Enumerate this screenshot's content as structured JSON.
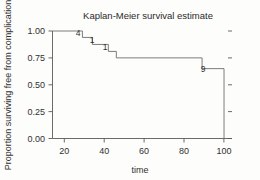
{
  "chart_data": {
    "type": "line",
    "subtype": "kaplan-meier-step",
    "title": "Kaplan-Meier survival estimate",
    "xlabel": "time",
    "ylabel": "Proportion surviving free from complication",
    "xlim": [
      14,
      104
    ],
    "ylim": [
      0.0,
      1.0
    ],
    "grid": false,
    "legend": "none",
    "xticks": [
      20,
      40,
      60,
      80,
      100
    ],
    "xtick_labels": [
      "20",
      "40",
      "60",
      "80",
      "100"
    ],
    "yticks": [
      0.0,
      0.25,
      0.5,
      0.75,
      1.0
    ],
    "ytick_labels": [
      "0.00",
      "0.25",
      "0.50",
      "0.75",
      "1.00"
    ],
    "series": [
      {
        "name": "survival",
        "step": "post",
        "x": [
          14,
          29,
          29,
          34,
          34,
          42,
          42,
          46,
          46,
          89,
          89,
          100,
          100
        ],
        "y": [
          1.0,
          1.0,
          0.94,
          0.94,
          0.875,
          0.875,
          0.81,
          0.81,
          0.75,
          0.75,
          0.65,
          0.65,
          0.0
        ]
      }
    ],
    "annotations": [
      {
        "text": "4",
        "x": 30.5,
        "y": 0.985
      },
      {
        "text": "1",
        "x": 37.5,
        "y": 0.925
      },
      {
        "text": "1",
        "x": 44.0,
        "y": 0.862
      },
      {
        "text": "9",
        "x": 92.0,
        "y": 0.7
      }
    ],
    "colors": {
      "curve": "#6d6d6d",
      "axis": "#5a5a5a",
      "text": "#303030",
      "background": "#fdfdfc"
    }
  }
}
